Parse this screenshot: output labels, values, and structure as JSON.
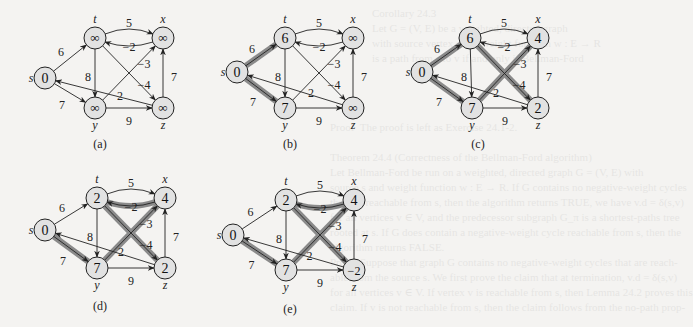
{
  "figure": {
    "colors": {
      "background": "#f4f3f1",
      "node_fill": "#e2e2e2",
      "node_stroke": "#222222",
      "edge": "#222222",
      "shaded_edge": "#8a8a8a",
      "shaded_edge_core": "#3a3a3a"
    },
    "node_labels": [
      "s",
      "t",
      "x",
      "y",
      "z"
    ],
    "edges": [
      {
        "from": "s",
        "to": "t",
        "w": "6"
      },
      {
        "from": "s",
        "to": "y",
        "w": "7"
      },
      {
        "from": "t",
        "to": "x",
        "w": "5"
      },
      {
        "from": "x",
        "to": "t",
        "w": "-2"
      },
      {
        "from": "t",
        "to": "y",
        "w": "8"
      },
      {
        "from": "t",
        "to": "z",
        "w": "-4"
      },
      {
        "from": "y",
        "to": "x",
        "w": "-3"
      },
      {
        "from": "y",
        "to": "z",
        "w": "9"
      },
      {
        "from": "z",
        "to": "x",
        "w": "7"
      },
      {
        "from": "z",
        "to": "s",
        "w": "2"
      }
    ],
    "panels": [
      {
        "label": "(a)",
        "pos": {
          "s": [
            45,
            78
          ],
          "t": [
            95,
            38
          ],
          "x": [
            163,
            38
          ],
          "y": [
            95,
            108
          ],
          "z": [
            163,
            108
          ]
        },
        "d": {
          "s": "0",
          "t": "∞",
          "x": "∞",
          "y": "∞",
          "z": "∞"
        },
        "shaded": [],
        "caption_pos": [
          100,
          148
        ]
      },
      {
        "label": "(b)",
        "pos": {
          "s": [
            237,
            72
          ],
          "t": [
            285,
            38
          ],
          "x": [
            353,
            38
          ],
          "y": [
            285,
            108
          ],
          "z": [
            353,
            108
          ]
        },
        "d": {
          "s": "0",
          "t": "6",
          "x": "∞",
          "y": "7",
          "z": "∞"
        },
        "shaded": [
          "s-t",
          "s-y"
        ],
        "caption_pos": [
          290,
          148
        ]
      },
      {
        "label": "(c)",
        "pos": {
          "s": [
            422,
            72
          ],
          "t": [
            470,
            38
          ],
          "x": [
            538,
            38
          ],
          "y": [
            472,
            108
          ],
          "z": [
            538,
            108
          ]
        },
        "d": {
          "s": "0",
          "t": "6",
          "x": "4",
          "y": "7",
          "z": "2"
        },
        "shaded": [
          "s-t",
          "s-y",
          "y-x",
          "t-z"
        ],
        "caption_pos": [
          478,
          148
        ]
      },
      {
        "label": "(d)",
        "pos": {
          "s": [
            45,
            230
          ],
          "t": [
            97,
            198
          ],
          "x": [
            165,
            198
          ],
          "y": [
            97,
            268
          ],
          "z": [
            165,
            268
          ]
        },
        "d": {
          "s": "0",
          "t": "2",
          "x": "4",
          "y": "7",
          "z": "2"
        },
        "shaded": [
          "s-y",
          "y-x",
          "x-t",
          "t-z"
        ],
        "caption_pos": [
          100,
          310
        ]
      },
      {
        "label": "(e)",
        "pos": {
          "s": [
            233,
            235
          ],
          "t": [
            286,
            200
          ],
          "x": [
            354,
            200
          ],
          "y": [
            286,
            270
          ],
          "z": [
            354,
            270
          ]
        },
        "d": {
          "s": "0",
          "t": "2",
          "x": "4",
          "y": "7",
          "z": "-2"
        },
        "shaded": [
          "s-y",
          "y-x",
          "x-t",
          "t-z"
        ],
        "caption_pos": [
          290,
          313
        ]
      }
    ]
  },
  "bleed_text": {
    "lines_top": [
      "Corollary 24.3",
      "Let G = (V, E) be a weighted, directed graph",
      "with source vertex s and weight function w : E → R",
      "is a path from s to v if and only if Bellman-Ford"
    ],
    "lines_mid": [
      "Proof  The proof is left as Exercise 24.1-2.",
      "",
      "Theorem 24.4 (Correctness of the Bellman-Ford algorithm)",
      "Let Bellman-Ford be run on a weighted, directed graph G = (V, E) with",
      "source s and weight function w : E → R. If G contains no negative-weight cycles",
      "that are reachable from s, then the algorithm returns TRUE, we have v.d = δ(s,v)",
      "for all vertices v ∈ V, and the predecessor subgraph G_π is a shortest-paths tree",
      "rooted at s. If G does contain a negative-weight cycle reachable from s, then the",
      "algorithm returns FALSE."
    ],
    "lines_bot": [
      "Proof  Suppose that graph G contains no negative-weight cycles that are reach-",
      "able from the source s. We first prove the claim that at termination, v.d = δ(s,v)",
      "for all vertices v ∈ V. If vertex v is reachable from s, then Lemma 24.2 proves this",
      "claim. If v is not reachable from s, then the claim follows from the no-path prop-"
    ]
  }
}
